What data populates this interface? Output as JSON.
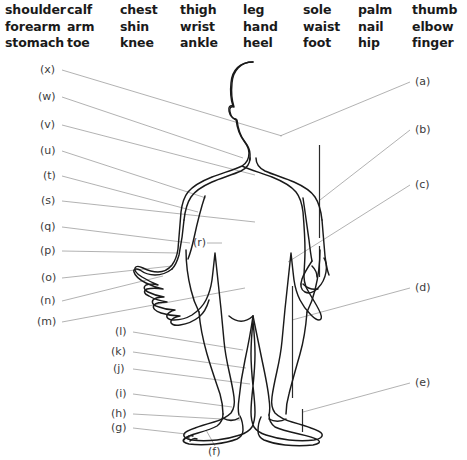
{
  "wordbank": {
    "columns": [
      [
        "shoulder",
        "forearm",
        "stomach"
      ],
      [
        "calf",
        "arm",
        "toe"
      ],
      [
        "chest",
        "shin",
        "knee"
      ],
      [
        "thigh",
        "wrist",
        "ankle"
      ],
      [
        "leg",
        "hand",
        "heel"
      ],
      [
        "sole",
        "waist",
        "foot"
      ],
      [
        "palm",
        "nail",
        "hip"
      ],
      [
        "thumb",
        "elbow",
        "finger"
      ]
    ]
  },
  "labels": {
    "left": [
      {
        "id": "x",
        "text": "(x)",
        "x": 40,
        "y": 70
      },
      {
        "id": "w",
        "text": "(w)",
        "x": 38,
        "y": 97
      },
      {
        "id": "v",
        "text": "(v)",
        "x": 40,
        "y": 125
      },
      {
        "id": "u",
        "text": "(u)",
        "x": 40,
        "y": 151
      },
      {
        "id": "t",
        "text": "(t)",
        "x": 42,
        "y": 176
      },
      {
        "id": "s",
        "text": "(s)",
        "x": 41,
        "y": 201
      },
      {
        "id": "q",
        "text": "(q)",
        "x": 40,
        "y": 227
      },
      {
        "id": "p",
        "text": "(p)",
        "x": 40,
        "y": 251
      },
      {
        "id": "o",
        "text": "(o)",
        "x": 41,
        "y": 278
      },
      {
        "id": "n",
        "text": "(n)",
        "x": 40,
        "y": 301
      },
      {
        "id": "m",
        "text": "(m)",
        "x": 37,
        "y": 322
      }
    ],
    "lower_left": [
      {
        "id": "l",
        "text": "(l)",
        "x": 114,
        "y": 332
      },
      {
        "id": "k",
        "text": "(k)",
        "x": 111,
        "y": 352
      },
      {
        "id": "j",
        "text": "(j)",
        "x": 113,
        "y": 369
      },
      {
        "id": "i",
        "text": "(i)",
        "x": 114,
        "y": 394
      },
      {
        "id": "h",
        "text": "(h)",
        "x": 111,
        "y": 414
      },
      {
        "id": "g",
        "text": "(g)",
        "x": 111,
        "y": 428
      }
    ],
    "right": [
      {
        "id": "a",
        "text": "(a)",
        "x": 415,
        "y": 82
      },
      {
        "id": "b",
        "text": "(b)",
        "x": 415,
        "y": 130
      },
      {
        "id": "c",
        "text": "(c)",
        "x": 415,
        "y": 185
      },
      {
        "id": "d",
        "text": "(d)",
        "x": 415,
        "y": 288
      },
      {
        "id": "e",
        "text": "(e)",
        "x": 415,
        "y": 383
      }
    ],
    "inner": [
      {
        "id": "r",
        "text": "(r)",
        "x": 195,
        "y": 243
      },
      {
        "id": "f",
        "text": "(f)",
        "x": 210,
        "y": 452
      }
    ]
  },
  "colors": {
    "outline": "#1a1a1a",
    "leader": "#9a9a9a",
    "bracket": "#2b2b2b",
    "text": "#1a1a1a",
    "label_text": "#3c3c3c",
    "background": "#ffffff"
  },
  "diagram": {
    "figure_name": "human-body-outline"
  }
}
